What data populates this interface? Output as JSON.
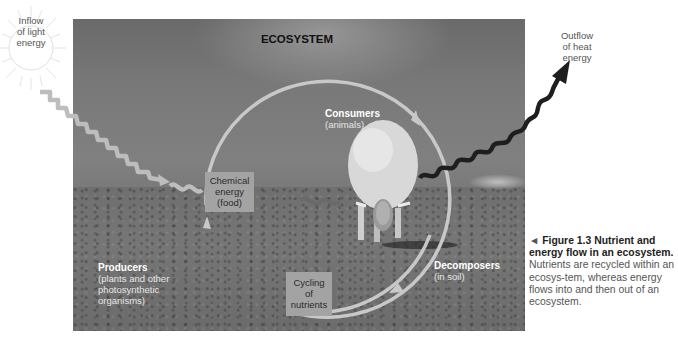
{
  "diagram": {
    "title": "ECOSYSTEM",
    "inflow": {
      "line1": "Inflow",
      "line2": "of light",
      "line3": "energy"
    },
    "outflow": {
      "line1": "Outflow",
      "line2": "of heat",
      "line3": "energy"
    },
    "consumers": {
      "name": "Consumers",
      "detail": "(animals)"
    },
    "producers": {
      "name": "Producers",
      "detail1": "(plants and other",
      "detail2": "photosynthetic",
      "detail3": "organisms)"
    },
    "decomposers": {
      "name": "Decomposers",
      "detail": "(in soil)"
    },
    "chemical_energy": {
      "line1": "Chemical",
      "line2": "energy",
      "line3": "(food)"
    },
    "cycling": {
      "line1": "Cycling",
      "line2": "of",
      "line3": "nutrients"
    },
    "colors": {
      "light_arrow": "#bdbdbd",
      "heat_arrow": "#1e1e1e",
      "cycle_arrow": "#c8c8c8",
      "box_fill": "#a3a3a3"
    }
  },
  "caption": {
    "marker": "◄",
    "figure_label": "Figure 1.3",
    "title": "Nutrient and energy flow in an ecosystem.",
    "body": "Nutrients are recycled within an ecosys-tem, whereas energy flows into and then out of an ecosystem."
  }
}
